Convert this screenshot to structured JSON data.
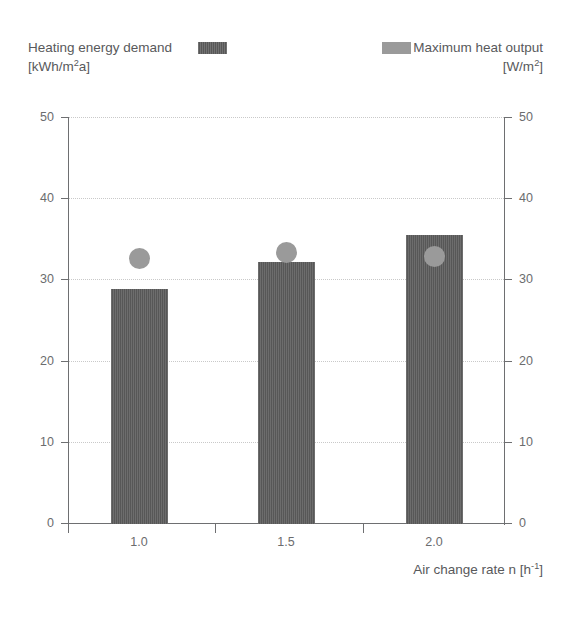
{
  "legend": {
    "left": {
      "label": "Heating energy demand",
      "unit_pre": "[kWh/m",
      "unit_sup": "2",
      "unit_post": "a]",
      "swatch_name": "bar-swatch",
      "color": "#575757"
    },
    "right": {
      "label": "Maximum heat output",
      "unit_pre": "[W/m",
      "unit_sup": "2",
      "unit_post": "]",
      "swatch_name": "dot-swatch",
      "color": "#9a9a9a"
    }
  },
  "axis": {
    "x_title_pre": "Air change rate n  [h",
    "x_title_sup": "-1",
    "x_title_post": "]",
    "y_ticks": [
      "0",
      "10",
      "20",
      "30",
      "40",
      "50"
    ],
    "x_ticks": [
      "1.0",
      "1.5",
      "2.0"
    ]
  },
  "chart_data": {
    "type": "bar",
    "title": "",
    "xlabel": "Air change rate n [h-1]",
    "ylabel": "",
    "ylim": [
      0,
      50
    ],
    "y2lim": [
      0,
      50
    ],
    "grid": true,
    "legend_position": "top",
    "categories": [
      "1.0",
      "1.5",
      "2.0"
    ],
    "series": [
      {
        "name": "Heating energy demand [kWh/m2a]",
        "type": "bar",
        "color": "#575757",
        "axis": "left",
        "values": [
          29.0,
          32.3,
          35.6
        ]
      },
      {
        "name": "Maximum heat output [W/m2]",
        "type": "scatter",
        "color": "#9a9a9a",
        "axis": "right",
        "values": [
          32.7,
          33.4,
          33.0
        ]
      }
    ]
  }
}
